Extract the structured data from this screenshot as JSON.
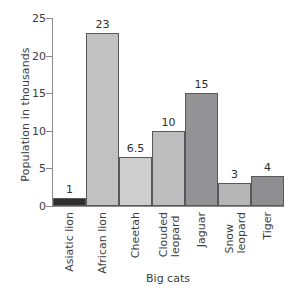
{
  "chart_data": {
    "type": "bar",
    "title": "",
    "xlabel": "Big cats",
    "ylabel": "Population in thousands",
    "categories": [
      "Asiatic lion",
      "African lion",
      "Cheetah",
      "Clouded leopard",
      "Jaguar",
      "Snow leopard",
      "Tiger"
    ],
    "category_lines": [
      [
        "Asiatic lion"
      ],
      [
        "African lion"
      ],
      [
        "Cheetah"
      ],
      [
        "Clouded",
        "leopard"
      ],
      [
        "Jaguar"
      ],
      [
        "Snow",
        "leopard"
      ],
      [
        "Tiger"
      ]
    ],
    "values": [
      1,
      23,
      6.5,
      10,
      15,
      3,
      4
    ],
    "value_labels": [
      "1",
      "23",
      "6.5",
      "10",
      "15",
      "3",
      "4"
    ],
    "bar_colors": [
      "#2f2f31",
      "#c1c1c1",
      "#cecece",
      "#bdbdbd",
      "#939395",
      "#b6b6b6",
      "#8f8f91"
    ],
    "bar_edge_color": "#58585a",
    "ylim": [
      0,
      25
    ],
    "yticks": [
      0,
      5,
      10,
      15,
      20,
      25
    ],
    "ytick_labels": [
      "0",
      "5",
      "10",
      "15",
      "20",
      "25"
    ],
    "grid": false,
    "legend": null,
    "axis_color": "#8c8c8c",
    "text_color": "#3d3d3d",
    "background": "#ffffff"
  }
}
